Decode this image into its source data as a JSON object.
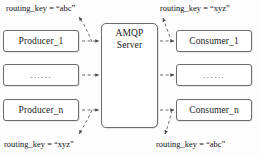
{
  "diagram": {
    "colors": {
      "background": "#fdfdfd",
      "box_border": "#6d6d6d",
      "text": "#1b1b1b",
      "arrow": "#5a5a5a"
    },
    "server": {
      "line1": "AMQP",
      "line2": "Server"
    },
    "producers": [
      {
        "label": "Producer_1"
      },
      {
        "label": "......"
      },
      {
        "label": "Producer_n"
      }
    ],
    "consumers": [
      {
        "label": "Consumer_1"
      },
      {
        "label": "......"
      },
      {
        "label": "Consumer_n"
      }
    ],
    "routing_keys": {
      "top_left": "routing_key = “abc”",
      "top_right": "routing_key = “xyz”",
      "bottom_left": "routing_key = “xyz”",
      "bottom_right": "routing_key = “abc”"
    }
  }
}
